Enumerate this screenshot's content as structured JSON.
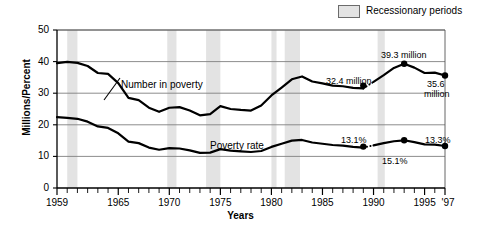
{
  "chart_data": {
    "type": "line",
    "title": "",
    "xlabel": "Years",
    "ylabel": "Millions/Percent",
    "xlim": [
      1959,
      1997
    ],
    "ylim": [
      0,
      50
    ],
    "yticks": [
      0,
      10,
      20,
      30,
      40,
      50
    ],
    "xticks": [
      1959,
      1965,
      1970,
      1975,
      1980,
      1985,
      1990,
      1995,
      1997
    ],
    "xtick_labels": [
      "1959",
      "1965",
      "1970",
      "1975",
      "1980",
      "1985",
      "1990",
      "1995",
      "'97"
    ],
    "grid": "horizontal",
    "legend_position": "top-right",
    "legend": [
      {
        "label": "Recessionary periods",
        "color": "#e3e3e3",
        "type": "band"
      }
    ],
    "x": [
      1959,
      1960,
      1961,
      1962,
      1963,
      1964,
      1965,
      1966,
      1967,
      1968,
      1969,
      1970,
      1971,
      1972,
      1973,
      1974,
      1975,
      1976,
      1977,
      1978,
      1979,
      1980,
      1981,
      1982,
      1983,
      1984,
      1985,
      1986,
      1987,
      1988,
      1989,
      1990,
      1991,
      1992,
      1993,
      1994,
      1995,
      1996,
      1997
    ],
    "series": [
      {
        "name": "Number in poverty",
        "unit": "millions",
        "values": [
          39.5,
          39.9,
          39.6,
          38.6,
          36.4,
          36.1,
          33.2,
          28.5,
          27.8,
          25.4,
          24.1,
          25.4,
          25.6,
          24.5,
          23.0,
          23.4,
          25.9,
          25.0,
          24.7,
          24.5,
          26.1,
          29.3,
          31.8,
          34.4,
          35.3,
          33.7,
          33.1,
          32.4,
          32.2,
          31.7,
          31.5,
          33.6,
          35.7,
          38.0,
          39.3,
          38.1,
          36.4,
          36.5,
          35.6
        ]
      },
      {
        "name": "Poverty rate",
        "unit": "percent",
        "values": [
          22.4,
          22.2,
          21.9,
          21.0,
          19.5,
          19.0,
          17.3,
          14.7,
          14.2,
          12.8,
          12.1,
          12.6,
          12.5,
          11.9,
          11.1,
          11.2,
          12.3,
          11.8,
          11.6,
          11.4,
          11.7,
          13.0,
          14.0,
          15.0,
          15.2,
          14.4,
          14.0,
          13.6,
          13.4,
          13.0,
          12.8,
          13.5,
          14.2,
          14.8,
          15.1,
          14.5,
          13.8,
          13.7,
          13.3
        ]
      }
    ],
    "series_labels": [
      {
        "text": "Number in poverty",
        "x": 121,
        "y": 79
      },
      {
        "text": "Poverty rate",
        "x": 210,
        "y": 140
      }
    ],
    "annotations": [
      {
        "text": "32.4 million",
        "value": 32.4,
        "year": 1989,
        "x": 326,
        "y": 76
      },
      {
        "text": "39.3 million",
        "value": 39.3,
        "year": 1993,
        "x": 381,
        "y": 50
      },
      {
        "text": "35.6",
        "value": 35.6,
        "year": 1997,
        "x": 427,
        "y": 79
      },
      {
        "text": "million",
        "x": 424,
        "y": 89
      },
      {
        "text": "13.1%",
        "value": 13.1,
        "year": 1989,
        "x": 341,
        "y": 135
      },
      {
        "text": "15.1%",
        "value": 15.1,
        "year": 1993,
        "x": 382,
        "y": 156
      },
      {
        "text": "13.3%",
        "value": 13.3,
        "year": 1997,
        "x": 425,
        "y": 135
      }
    ],
    "markers": [
      {
        "series": "Number in poverty",
        "year": 1989,
        "value": 32.4
      },
      {
        "series": "Number in poverty",
        "year": 1993,
        "value": 39.3
      },
      {
        "series": "Number in poverty",
        "year": 1997,
        "value": 35.6
      },
      {
        "series": "Poverty rate",
        "year": 1989,
        "value": 13.1
      },
      {
        "series": "Poverty rate",
        "year": 1993,
        "value": 15.1
      },
      {
        "series": "Poverty rate",
        "year": 1997,
        "value": 13.3
      }
    ],
    "break_segments": [
      {
        "series": "Number in poverty",
        "from_year": 1989,
        "to_year": 1990,
        "style": "dotted"
      },
      {
        "series": "Poverty rate",
        "from_year": 1989,
        "to_year": 1990,
        "style": "dotted"
      }
    ],
    "recession_bands": [
      {
        "start": 1960.0,
        "end": 1961.0
      },
      {
        "start": 1969.8,
        "end": 1970.7
      },
      {
        "start": 1973.6,
        "end": 1975.0
      },
      {
        "start": 1980.0,
        "end": 1980.5
      },
      {
        "start": 1981.3,
        "end": 1982.8
      },
      {
        "start": 1990.4,
        "end": 1991.1
      }
    ],
    "colors": {
      "line": "#000000",
      "band": "#e3e3e3",
      "grid": "#808080",
      "axis": "#000000",
      "background": "#ffffff"
    }
  }
}
